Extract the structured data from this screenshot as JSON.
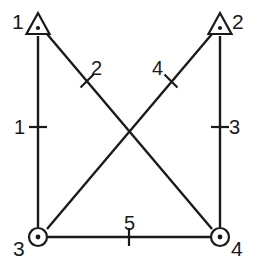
{
  "diagram": {
    "type": "graph",
    "title": "",
    "background_color": "#ffffff",
    "stroke_color": "#1a1a1a",
    "nodes": [
      {
        "id": "1",
        "label": "1",
        "shape": "triangle-with-dot",
        "x": 38,
        "y": 25,
        "label_x": 12,
        "label_y": 11
      },
      {
        "id": "2",
        "label": "2",
        "shape": "triangle-with-dot",
        "x": 220,
        "y": 25,
        "label_x": 232,
        "label_y": 11
      },
      {
        "id": "3",
        "label": "3",
        "shape": "circle-with-dot",
        "x": 38,
        "y": 237,
        "label_x": 13,
        "label_y": 238
      },
      {
        "id": "4",
        "label": "4",
        "shape": "circle-with-dot",
        "x": 220,
        "y": 237,
        "label_x": 231,
        "label_y": 238
      }
    ],
    "edges": [
      {
        "id": "1",
        "label": "1",
        "from": "1",
        "to": "3",
        "x1": 38,
        "y1": 36,
        "x2": 38,
        "y2": 227,
        "tick_x": 38,
        "tick_y": 127,
        "label_x": 14,
        "label_y": 117
      },
      {
        "id": "2",
        "label": "2",
        "from": "1",
        "to": "4",
        "x1": 47,
        "y1": 34,
        "x2": 212,
        "y2": 229,
        "tick_x": 87,
        "tick_y": 81,
        "label_x": 91,
        "label_y": 58
      },
      {
        "id": "3",
        "label": "3",
        "from": "2",
        "to": "4",
        "x1": 220,
        "y1": 36,
        "x2": 220,
        "y2": 227,
        "tick_x": 220,
        "tick_y": 127,
        "label_x": 229,
        "label_y": 117
      },
      {
        "id": "4",
        "label": "4",
        "from": "3",
        "to": "2",
        "x1": 47,
        "y1": 229,
        "x2": 212,
        "y2": 34,
        "tick_x": 171,
        "tick_y": 81,
        "label_x": 152,
        "label_y": 58
      },
      {
        "id": "5",
        "label": "5",
        "from": "3",
        "to": "4",
        "x1": 48,
        "y1": 237,
        "x2": 210,
        "y2": 237,
        "tick_x": 129,
        "tick_y": 237,
        "label_x": 124,
        "label_y": 213
      }
    ]
  }
}
